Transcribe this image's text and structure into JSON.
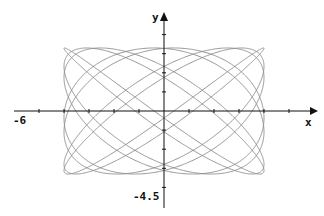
{
  "chart_data": {
    "type": "line",
    "title": "",
    "subtitle": "",
    "xlabel": "x",
    "ylabel": "y",
    "xlim": [
      -6,
      6.3
    ],
    "ylim": [
      -4.5,
      4.4
    ],
    "grid": false,
    "legend": null,
    "x_tick_label": "-6",
    "y_tick_label": "-4.5",
    "x_tick_step": 1,
    "y_tick_step": 1,
    "series": [
      {
        "name": "Lissajous curve",
        "parametric": true,
        "x_equation": "x = 4 sin(7t)",
        "y_equation": "y = 3.3 sin(8t + 0.785)",
        "x_amplitude": 4,
        "y_amplitude": 3.3,
        "x_frequency": 7,
        "y_frequency": 8,
        "phase": 0.785,
        "t_range": [
          0,
          6.2832
        ],
        "color": "#8a8a8a"
      }
    ]
  },
  "axes": {
    "x_label": "x",
    "y_label": "y",
    "x_min_label": "-6",
    "y_min_label": "-4.5",
    "axis_color": "#111111"
  }
}
